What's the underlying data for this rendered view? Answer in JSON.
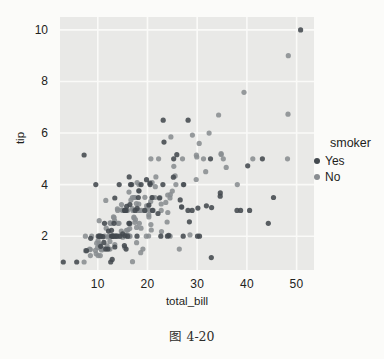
{
  "figure": {
    "caption": "图 4-20"
  },
  "chart_data": {
    "type": "scatter",
    "title": "",
    "xlabel": "total_bill",
    "ylabel": "tip",
    "x_ticks": [
      10,
      20,
      30,
      40,
      50
    ],
    "y_ticks": [
      2,
      4,
      6,
      8,
      10
    ],
    "xlim": [
      2.4,
      53.5
    ],
    "ylim": [
      0.69,
      10.5
    ],
    "grid": true,
    "panel_bg": "#e9e9e7",
    "grid_color": "#fafaf8",
    "point_radius": 2.6,
    "legend": {
      "title": "smoker",
      "position": "right",
      "entries": [
        {
          "label": "Yes",
          "color": "#43494f"
        },
        {
          "label": "No",
          "color": "#898d91"
        }
      ]
    },
    "series": [
      {
        "name": "Yes",
        "color": "#43494f",
        "points": [
          [
            38.01,
            3.0
          ],
          [
            11.24,
            1.76
          ],
          [
            20.29,
            3.21
          ],
          [
            13.81,
            2.0
          ],
          [
            11.02,
            1.98
          ],
          [
            18.29,
            3.76
          ],
          [
            3.07,
            1.0
          ],
          [
            15.01,
            2.09
          ],
          [
            26.86,
            3.14
          ],
          [
            25.28,
            5.0
          ],
          [
            17.92,
            3.08
          ],
          [
            19.44,
            3.0
          ],
          [
            32.68,
            5.0
          ],
          [
            28.97,
            3.0
          ],
          [
            5.75,
            1.0
          ],
          [
            16.32,
            4.3
          ],
          [
            40.17,
            4.73
          ],
          [
            27.28,
            4.0
          ],
          [
            12.03,
            1.5
          ],
          [
            21.01,
            3.0
          ],
          [
            11.35,
            2.5
          ],
          [
            15.38,
            3.0
          ],
          [
            44.3,
            2.5
          ],
          [
            22.42,
            3.48
          ],
          [
            15.36,
            1.64
          ],
          [
            20.49,
            4.06
          ],
          [
            25.21,
            4.29
          ],
          [
            14.31,
            4.0
          ],
          [
            16.0,
            2.0
          ],
          [
            17.51,
            3.0
          ],
          [
            10.59,
            1.61
          ],
          [
            10.63,
            2.0
          ],
          [
            50.81,
            10.0
          ],
          [
            15.81,
            3.16
          ],
          [
            7.25,
            5.15
          ],
          [
            31.85,
            3.18
          ],
          [
            16.82,
            4.0
          ],
          [
            32.9,
            3.11
          ],
          [
            17.89,
            2.0
          ],
          [
            14.48,
            2.0
          ],
          [
            9.6,
            4.0
          ],
          [
            34.63,
            3.55
          ],
          [
            34.65,
            3.68
          ],
          [
            23.33,
            5.65
          ],
          [
            45.35,
            3.5
          ],
          [
            23.17,
            6.5
          ],
          [
            40.55,
            3.0
          ],
          [
            20.9,
            3.5
          ],
          [
            30.46,
            2.0
          ],
          [
            18.15,
            3.5
          ],
          [
            23.1,
            4.0
          ],
          [
            15.69,
            1.5
          ],
          [
            19.81,
            4.19
          ],
          [
            28.44,
            2.56
          ],
          [
            15.48,
            2.02
          ],
          [
            16.58,
            4.0
          ],
          [
            10.34,
            2.0
          ],
          [
            43.11,
            5.0
          ],
          [
            13.0,
            2.0
          ],
          [
            13.51,
            2.0
          ],
          [
            18.71,
            4.0
          ],
          [
            12.74,
            2.01
          ],
          [
            13.0,
            2.0
          ],
          [
            16.4,
            2.5
          ],
          [
            20.53,
            4.0
          ],
          [
            16.47,
            3.23
          ],
          [
            26.59,
            3.41
          ],
          [
            38.73,
            3.0
          ],
          [
            24.27,
            2.03
          ],
          [
            12.76,
            2.23
          ],
          [
            30.06,
            2.0
          ],
          [
            25.89,
            5.16
          ],
          [
            13.27,
            2.5
          ],
          [
            28.17,
            6.5
          ],
          [
            12.9,
            1.1
          ],
          [
            28.15,
            3.0
          ],
          [
            11.59,
            1.5
          ],
          [
            7.74,
            1.44
          ],
          [
            30.14,
            3.09
          ],
          [
            12.16,
            2.2
          ],
          [
            13.42,
            3.48
          ],
          [
            8.58,
            1.92
          ],
          [
            13.42,
            1.58
          ],
          [
            16.27,
            2.5
          ],
          [
            10.09,
            2.0
          ],
          [
            22.12,
            2.88
          ],
          [
            24.01,
            2.0
          ],
          [
            15.69,
            3.0
          ],
          [
            15.53,
            3.0
          ],
          [
            12.6,
            1.0
          ],
          [
            32.83,
            1.17
          ],
          [
            27.18,
            2.0
          ],
          [
            22.67,
            2.0
          ]
        ]
      },
      {
        "name": "No",
        "color": "#898d91",
        "points": [
          [
            16.99,
            1.01
          ],
          [
            10.34,
            1.66
          ],
          [
            21.01,
            3.5
          ],
          [
            23.68,
            3.31
          ],
          [
            24.59,
            3.61
          ],
          [
            25.29,
            4.71
          ],
          [
            8.77,
            2.0
          ],
          [
            26.88,
            3.12
          ],
          [
            15.04,
            1.96
          ],
          [
            14.78,
            3.23
          ],
          [
            10.27,
            1.71
          ],
          [
            35.26,
            5.0
          ],
          [
            15.42,
            1.57
          ],
          [
            18.43,
            3.0
          ],
          [
            14.83,
            3.02
          ],
          [
            21.58,
            3.92
          ],
          [
            10.33,
            1.67
          ],
          [
            16.29,
            3.71
          ],
          [
            16.97,
            3.5
          ],
          [
            20.65,
            3.35
          ],
          [
            17.92,
            4.08
          ],
          [
            20.29,
            2.75
          ],
          [
            15.77,
            2.23
          ],
          [
            39.42,
            7.58
          ],
          [
            19.82,
            3.18
          ],
          [
            17.81,
            2.34
          ],
          [
            13.37,
            2.0
          ],
          [
            12.69,
            2.0
          ],
          [
            21.7,
            4.3
          ],
          [
            19.65,
            3.0
          ],
          [
            9.55,
            1.45
          ],
          [
            18.35,
            2.5
          ],
          [
            15.06,
            3.0
          ],
          [
            20.69,
            2.45
          ],
          [
            17.78,
            3.27
          ],
          [
            24.06,
            3.6
          ],
          [
            16.31,
            2.0
          ],
          [
            16.93,
            3.07
          ],
          [
            18.69,
            2.31
          ],
          [
            31.27,
            5.0
          ],
          [
            16.04,
            2.24
          ],
          [
            17.46,
            2.54
          ],
          [
            13.94,
            3.06
          ],
          [
            9.68,
            1.32
          ],
          [
            30.4,
            5.6
          ],
          [
            18.29,
            3.0
          ],
          [
            22.23,
            5.0
          ],
          [
            32.4,
            6.0
          ],
          [
            28.55,
            2.05
          ],
          [
            18.04,
            3.0
          ],
          [
            12.54,
            2.5
          ],
          [
            10.29,
            2.6
          ],
          [
            34.81,
            5.2
          ],
          [
            9.94,
            1.56
          ],
          [
            25.56,
            4.34
          ],
          [
            19.49,
            3.51
          ],
          [
            26.41,
            1.5
          ],
          [
            48.27,
            6.73
          ],
          [
            17.59,
            2.64
          ],
          [
            20.08,
            3.15
          ],
          [
            16.45,
            2.47
          ],
          [
            20.23,
            2.01
          ],
          [
            12.02,
            1.97
          ],
          [
            17.07,
            3.0
          ],
          [
            14.73,
            2.2
          ],
          [
            10.51,
            1.25
          ],
          [
            27.2,
            4.0
          ],
          [
            22.76,
            3.0
          ],
          [
            17.29,
            2.71
          ],
          [
            16.66,
            3.4
          ],
          [
            10.07,
            1.83
          ],
          [
            15.98,
            2.03
          ],
          [
            34.83,
            5.17
          ],
          [
            13.03,
            2.0
          ],
          [
            18.28,
            4.0
          ],
          [
            24.71,
            5.85
          ],
          [
            21.16,
            3.0
          ],
          [
            22.49,
            3.5
          ],
          [
            22.75,
            3.25
          ],
          [
            12.46,
            1.5
          ],
          [
            20.92,
            4.08
          ],
          [
            18.24,
            3.76
          ],
          [
            14.0,
            3.0
          ],
          [
            7.25,
            1.0
          ],
          [
            38.07,
            4.0
          ],
          [
            23.95,
            2.55
          ],
          [
            25.71,
            4.0
          ],
          [
            17.31,
            3.5
          ],
          [
            29.93,
            5.07
          ],
          [
            10.65,
            1.5
          ],
          [
            12.43,
            1.8
          ],
          [
            24.08,
            2.92
          ],
          [
            11.69,
            2.31
          ],
          [
            13.42,
            1.68
          ],
          [
            14.26,
            2.5
          ],
          [
            15.95,
            2.0
          ],
          [
            12.48,
            2.52
          ],
          [
            29.8,
            4.2
          ],
          [
            8.52,
            1.48
          ],
          [
            14.52,
            2.0
          ],
          [
            11.38,
            2.0
          ],
          [
            22.82,
            2.18
          ],
          [
            19.08,
            1.5
          ],
          [
            20.27,
            2.83
          ],
          [
            11.17,
            1.5
          ],
          [
            12.26,
            2.0
          ],
          [
            18.26,
            3.25
          ],
          [
            8.51,
            1.25
          ],
          [
            10.33,
            2.0
          ],
          [
            14.15,
            2.0
          ],
          [
            13.16,
            2.75
          ],
          [
            17.47,
            3.5
          ],
          [
            34.3,
            6.7
          ],
          [
            41.19,
            5.0
          ],
          [
            27.05,
            5.0
          ],
          [
            16.43,
            2.3
          ],
          [
            8.35,
            1.5
          ],
          [
            18.64,
            1.36
          ],
          [
            11.87,
            1.63
          ],
          [
            9.78,
            1.73
          ],
          [
            7.51,
            2.0
          ],
          [
            14.07,
            2.5
          ],
          [
            13.13,
            2.0
          ],
          [
            17.26,
            2.74
          ],
          [
            24.55,
            2.0
          ],
          [
            19.77,
            2.0
          ],
          [
            29.85,
            5.14
          ],
          [
            48.17,
            5.0
          ],
          [
            25.0,
            3.75
          ],
          [
            13.39,
            2.61
          ],
          [
            16.49,
            2.0
          ],
          [
            21.5,
            3.5
          ],
          [
            12.66,
            2.5
          ],
          [
            16.21,
            2.0
          ],
          [
            13.81,
            2.0
          ],
          [
            24.52,
            3.48
          ],
          [
            20.76,
            2.24
          ],
          [
            31.71,
            4.5
          ],
          [
            20.69,
            5.0
          ],
          [
            7.56,
            1.44
          ],
          [
            48.33,
            9.0
          ],
          [
            15.98,
            3.0
          ],
          [
            20.45,
            3.0
          ],
          [
            13.28,
            2.72
          ],
          [
            11.61,
            3.39
          ],
          [
            10.77,
            1.47
          ],
          [
            10.07,
            1.25
          ],
          [
            35.83,
            4.67
          ],
          [
            29.03,
            5.92
          ],
          [
            17.82,
            1.75
          ],
          [
            18.78,
            3.0
          ]
        ]
      }
    ]
  }
}
